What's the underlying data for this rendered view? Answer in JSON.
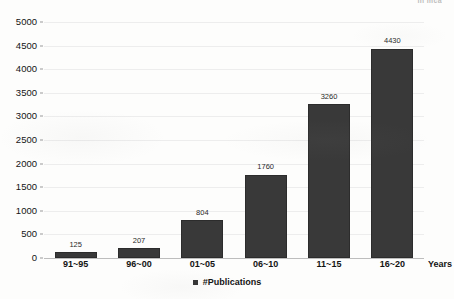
{
  "header": {
    "scrap_text": "in mca"
  },
  "chart_data": {
    "type": "bar",
    "title": "",
    "subtitle": "",
    "xlabel": "Years",
    "ylabel": "",
    "categories": [
      "91~95",
      "96~00",
      "01~05",
      "06~10",
      "11~15",
      "16~20"
    ],
    "values": [
      125,
      207,
      804,
      1760,
      3260,
      4430
    ],
    "series": [
      {
        "name": "#Publications",
        "values": [
          125,
          207,
          804,
          1760,
          3260,
          4430
        ],
        "color": "#393939"
      }
    ],
    "data_labels": [
      "125",
      "207",
      "804",
      "1760",
      "3260",
      "4430"
    ],
    "ylim": [
      0,
      5000
    ],
    "ytick_values": [
      0,
      500,
      1000,
      1500,
      2000,
      2500,
      3000,
      3500,
      4000,
      4500,
      5000
    ],
    "ytick_labels": [
      "0",
      "500",
      "1000",
      "1500",
      "2000",
      "2500",
      "3000",
      "3500",
      "4000",
      "4500",
      "5000"
    ],
    "grid": true,
    "grid_color": "#ededed",
    "legend_position": "bottom",
    "legend_entries": [
      "#Publications"
    ],
    "bar_color": "#393939",
    "background_color": "#fdfdfc"
  },
  "legend": {
    "marker_icon": "square-marker-icon",
    "label": "#Publications"
  }
}
